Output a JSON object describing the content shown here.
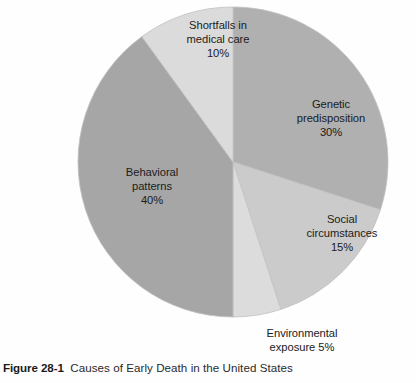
{
  "figure": {
    "caption_number": "Figure 28-1",
    "caption_text": "Causes of Early Death in the United States"
  },
  "chart_data": {
    "type": "pie",
    "title": "Causes of Early Death in the United States",
    "legend_position": "none",
    "start_angle_deg": 0,
    "direction": "clockwise",
    "center": [
      233,
      162
    ],
    "radius": 155,
    "categories": [
      "Genetic predisposition",
      "Social circumstances",
      "Environmental exposure",
      "Behavioral patterns",
      "Shortfalls in medical care"
    ],
    "values": [
      30,
      15,
      5,
      40,
      10
    ],
    "unit": "%",
    "slices": [
      {
        "label_line1": "Genetic",
        "label_line2": "predisposition",
        "value_text": "30%",
        "value": 30,
        "color": "#b0b0b0"
      },
      {
        "label_line1": "Social",
        "label_line2": "circumstances",
        "value_text": "15%",
        "value": 15,
        "color": "#cbcbcb"
      },
      {
        "label_line1": "Environmental",
        "label_line2": "exposure 5%",
        "value_text": "5%",
        "value": 5,
        "color": "#dcdcdc"
      },
      {
        "label_line1": "Behavioral",
        "label_line2": "patterns",
        "value_text": "40%",
        "value": 40,
        "color": "#a6a6a6"
      },
      {
        "label_line1": "Shortfalls in",
        "label_line2": "medical care",
        "value_text": "10%",
        "value": 10,
        "color": "#dbdbdb"
      }
    ]
  },
  "colors": {
    "background": "#fefefe",
    "text": "#1b1b1b",
    "caption": "#2a2a2a",
    "slice_outline": "#c2c2c2"
  }
}
